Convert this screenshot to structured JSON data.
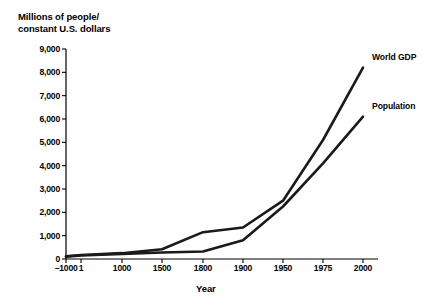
{
  "chart_data": {
    "type": "line",
    "title": "",
    "ylabel": "Millions of people/\nconstant U.S. dollars",
    "xlabel": "Year",
    "grid": false,
    "legend_position": "inline-right",
    "ylim": [
      0,
      9000
    ],
    "ytick_labels": [
      "0",
      "1,000",
      "2,000",
      "3,000",
      "4,000",
      "5,000",
      "6,000",
      "7,000",
      "8,000",
      "9,000"
    ],
    "ytick_values": [
      0,
      1000,
      2000,
      3000,
      4000,
      5000,
      6000,
      7000,
      8000,
      9000
    ],
    "xtick_labels": [
      "−1000",
      "1",
      "1000",
      "1500",
      "1800",
      "1900",
      "1950",
      "1975",
      "2000"
    ],
    "xtick_values": [
      -1000,
      1,
      1000,
      1500,
      1800,
      1900,
      1950,
      1975,
      2000
    ],
    "x_axis_scale": "categorical-uneven",
    "series": [
      {
        "name": "World GDP",
        "color": "#1a1a1a",
        "values": [
          120,
          170,
          250,
          420,
          1150,
          1350,
          2500,
          5100,
          8200
        ]
      },
      {
        "name": "Population",
        "color": "#1a1a1a",
        "values": [
          100,
          150,
          220,
          280,
          320,
          800,
          2250,
          4100,
          6100
        ]
      }
    ],
    "annotations": [
      {
        "text": "World GDP",
        "series": "World GDP"
      },
      {
        "text": "Population",
        "series": "Population"
      }
    ]
  },
  "axes": {
    "y_title": "Millions of people/\nconstant U.S. dollars",
    "x_title": "Year"
  }
}
